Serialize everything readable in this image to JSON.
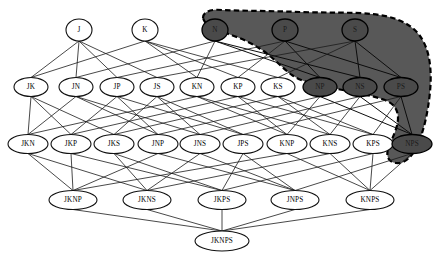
{
  "figure": {
    "type": "hasse-diagram",
    "ground_set": [
      "J",
      "K",
      "N",
      "P",
      "S"
    ],
    "colors": {
      "node_fill": "#ffffff",
      "node_stroke": "#111111",
      "edge": "#1a1a1a",
      "region_fill": "#585858",
      "region_border": "#000000",
      "shaded_node_fill": "#4a4a4a"
    },
    "highlight_region": {
      "name": "shaded-sublattice",
      "border_style": "dashed",
      "members": [
        "N",
        "P",
        "S",
        "NP",
        "NS",
        "PS",
        "NPS"
      ]
    }
  },
  "levels": [
    {
      "rank": 1,
      "y": 30,
      "nodes": [
        {
          "id": "J",
          "label": "J",
          "x": 79,
          "shaded": false,
          "rx": 13,
          "ry": 11
        },
        {
          "id": "K",
          "label": "K",
          "x": 145,
          "shaded": false,
          "rx": 13,
          "ry": 11
        },
        {
          "id": "N",
          "label": "N",
          "x": 215,
          "shaded": true,
          "rx": 13,
          "ry": 11
        },
        {
          "id": "P",
          "label": "P",
          "x": 285,
          "shaded": true,
          "rx": 13,
          "ry": 11
        },
        {
          "id": "S",
          "label": "S",
          "x": 355,
          "shaded": true,
          "rx": 13,
          "ry": 11
        }
      ]
    },
    {
      "rank": 2,
      "y": 87,
      "nodes": [
        {
          "id": "JK",
          "label": "JK",
          "x": 31,
          "shaded": false,
          "rx": 17,
          "ry": 9.5
        },
        {
          "id": "JN",
          "label": "JN",
          "x": 76,
          "shaded": false,
          "rx": 17,
          "ry": 9.5
        },
        {
          "id": "JP",
          "label": "JP",
          "x": 117,
          "shaded": false,
          "rx": 17,
          "ry": 9.5
        },
        {
          "id": "JS",
          "label": "JS",
          "x": 157,
          "shaded": false,
          "rx": 17,
          "ry": 9.5
        },
        {
          "id": "KN",
          "label": "KN",
          "x": 197,
          "shaded": false,
          "rx": 17,
          "ry": 9.5
        },
        {
          "id": "KP",
          "label": "KP",
          "x": 238,
          "shaded": false,
          "rx": 17,
          "ry": 9.5
        },
        {
          "id": "KS",
          "label": "KS",
          "x": 278,
          "shaded": false,
          "rx": 17,
          "ry": 9.5
        },
        {
          "id": "NP",
          "label": "NP",
          "x": 320,
          "shaded": true,
          "rx": 17,
          "ry": 9.5
        },
        {
          "id": "NS",
          "label": "NS",
          "x": 360,
          "shaded": true,
          "rx": 17,
          "ry": 9.5
        },
        {
          "id": "PS",
          "label": "PS",
          "x": 401,
          "shaded": true,
          "rx": 17,
          "ry": 9.5
        }
      ]
    },
    {
      "rank": 3,
      "y": 144,
      "nodes": [
        {
          "id": "JKN",
          "label": "JKN",
          "x": 28,
          "shaded": false,
          "rx": 20,
          "ry": 9.5
        },
        {
          "id": "JKP",
          "label": "JKP",
          "x": 71,
          "shaded": false,
          "rx": 20,
          "ry": 9.5
        },
        {
          "id": "JKS",
          "label": "JKS",
          "x": 114,
          "shaded": false,
          "rx": 20,
          "ry": 9.5
        },
        {
          "id": "JNP",
          "label": "JNP",
          "x": 158,
          "shaded": false,
          "rx": 20,
          "ry": 9.5
        },
        {
          "id": "JNS",
          "label": "JNS",
          "x": 200,
          "shaded": false,
          "rx": 20,
          "ry": 9.5
        },
        {
          "id": "JPS",
          "label": "JPS",
          "x": 243,
          "shaded": false,
          "rx": 20,
          "ry": 9.5
        },
        {
          "id": "KNP",
          "label": "KNP",
          "x": 287,
          "shaded": false,
          "rx": 20,
          "ry": 9.5
        },
        {
          "id": "KNS",
          "label": "KNS",
          "x": 330,
          "shaded": false,
          "rx": 20,
          "ry": 9.5
        },
        {
          "id": "KPS",
          "label": "KPS",
          "x": 373,
          "shaded": false,
          "rx": 20,
          "ry": 9.5
        },
        {
          "id": "NPS",
          "label": "NPS",
          "x": 412,
          "shaded": true,
          "rx": 20,
          "ry": 9.5
        }
      ]
    },
    {
      "rank": 4,
      "y": 200,
      "nodes": [
        {
          "id": "JKNP",
          "label": "JKNP",
          "x": 73,
          "shaded": false,
          "rx": 24,
          "ry": 9.5
        },
        {
          "id": "JKNS",
          "label": "JKNS",
          "x": 147,
          "shaded": false,
          "rx": 24,
          "ry": 9.5
        },
        {
          "id": "JKPS",
          "label": "JKPS",
          "x": 222,
          "shaded": false,
          "rx": 24,
          "ry": 9.5
        },
        {
          "id": "JNPS",
          "label": "JNPS",
          "x": 295,
          "shaded": false,
          "rx": 24,
          "ry": 9.5
        },
        {
          "id": "KNPS",
          "label": "KNPS",
          "x": 370,
          "shaded": false,
          "rx": 24,
          "ry": 9.5
        }
      ]
    },
    {
      "rank": 5,
      "y": 241,
      "nodes": [
        {
          "id": "JKNPS",
          "label": "JKNPS",
          "x": 222,
          "shaded": false,
          "rx": 27,
          "ry": 10
        }
      ]
    }
  ],
  "edges": [
    [
      "J",
      "JK"
    ],
    [
      "J",
      "JN"
    ],
    [
      "J",
      "JP"
    ],
    [
      "J",
      "JS"
    ],
    [
      "K",
      "JK"
    ],
    [
      "K",
      "KN"
    ],
    [
      "K",
      "KP"
    ],
    [
      "K",
      "KS"
    ],
    [
      "N",
      "JN"
    ],
    [
      "N",
      "KN"
    ],
    [
      "N",
      "NP"
    ],
    [
      "N",
      "NS"
    ],
    [
      "P",
      "JP"
    ],
    [
      "P",
      "KP"
    ],
    [
      "P",
      "NP"
    ],
    [
      "P",
      "PS"
    ],
    [
      "S",
      "JS"
    ],
    [
      "S",
      "KS"
    ],
    [
      "S",
      "NS"
    ],
    [
      "S",
      "PS"
    ],
    [
      "JK",
      "JKN"
    ],
    [
      "JK",
      "JKP"
    ],
    [
      "JK",
      "JKS"
    ],
    [
      "JN",
      "JKN"
    ],
    [
      "JN",
      "JNP"
    ],
    [
      "JN",
      "JNS"
    ],
    [
      "JP",
      "JKP"
    ],
    [
      "JP",
      "JNP"
    ],
    [
      "JP",
      "JPS"
    ],
    [
      "JS",
      "JKS"
    ],
    [
      "JS",
      "JNS"
    ],
    [
      "JS",
      "JPS"
    ],
    [
      "KN",
      "JKN"
    ],
    [
      "KN",
      "KNP"
    ],
    [
      "KN",
      "KNS"
    ],
    [
      "KP",
      "JKP"
    ],
    [
      "KP",
      "KNP"
    ],
    [
      "KP",
      "KPS"
    ],
    [
      "KS",
      "JKS"
    ],
    [
      "KS",
      "KNS"
    ],
    [
      "KS",
      "KPS"
    ],
    [
      "NP",
      "JNP"
    ],
    [
      "NP",
      "KNP"
    ],
    [
      "NP",
      "NPS"
    ],
    [
      "NS",
      "JNS"
    ],
    [
      "NS",
      "KNS"
    ],
    [
      "NS",
      "NPS"
    ],
    [
      "PS",
      "JPS"
    ],
    [
      "PS",
      "KPS"
    ],
    [
      "PS",
      "NPS"
    ],
    [
      "JKN",
      "JKNP"
    ],
    [
      "JKN",
      "JKNS"
    ],
    [
      "JKP",
      "JKNP"
    ],
    [
      "JKP",
      "JKPS"
    ],
    [
      "JKS",
      "JKNS"
    ],
    [
      "JKS",
      "JKPS"
    ],
    [
      "JNP",
      "JKNP"
    ],
    [
      "JNP",
      "JNPS"
    ],
    [
      "JNS",
      "JKNS"
    ],
    [
      "JNS",
      "JNPS"
    ],
    [
      "JPS",
      "JKPS"
    ],
    [
      "JPS",
      "JNPS"
    ],
    [
      "KNP",
      "JKNP"
    ],
    [
      "KNP",
      "KNPS"
    ],
    [
      "KNS",
      "JKNS"
    ],
    [
      "KNS",
      "KNPS"
    ],
    [
      "KPS",
      "JKPS"
    ],
    [
      "KPS",
      "KNPS"
    ],
    [
      "NPS",
      "JNPS"
    ],
    [
      "NPS",
      "KNPS"
    ],
    [
      "JKNP",
      "JKNPS"
    ],
    [
      "JKNS",
      "JKNPS"
    ],
    [
      "JKPS",
      "JKNPS"
    ],
    [
      "JNPS",
      "JKNPS"
    ],
    [
      "KNPS",
      "JKNPS"
    ]
  ],
  "region_path": "M 203 18 C 203 11, 212 9, 222 10 C 248 11, 275 11, 300 12 C 326 13, 352 12, 372 14 C 392 16, 410 22, 420 36 C 430 50, 432 70, 430 92 C 428 112, 424 130, 418 144 C 412 158, 404 164, 396 163 C 388 162, 386 156, 388 149 C 392 138, 398 128, 398 118 C 398 108, 392 102, 382 99 C 366 94, 348 91, 332 88 C 316 85, 302 82, 292 75 C 282 68, 274 58, 262 50 C 250 42, 236 36, 222 32 C 212 29, 205 25, 203 18 Z"
}
